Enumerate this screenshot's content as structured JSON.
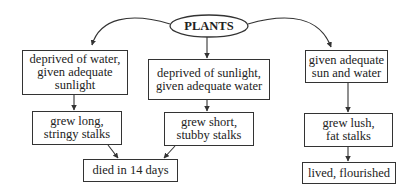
{
  "diagram": {
    "root": {
      "label": "PLANTS"
    },
    "nodes": [
      {
        "id": "n1",
        "label": "deprived of water,\ngiven adequate\nsunlight"
      },
      {
        "id": "n2",
        "label": "deprived of sunlight,\ngiven adequate water"
      },
      {
        "id": "n3",
        "label": "given adequate\nsun and water"
      },
      {
        "id": "n4",
        "label": "grew long,\nstringy stalks"
      },
      {
        "id": "n5",
        "label": "grew short,\nstubby stalks"
      },
      {
        "id": "n6",
        "label": "died in 14 days"
      },
      {
        "id": "n7",
        "label": "grew lush,\nfat stalks"
      },
      {
        "id": "n8",
        "label": "lived, flourished"
      }
    ],
    "edges": [
      [
        "root",
        "n1"
      ],
      [
        "root",
        "n2"
      ],
      [
        "root",
        "n3"
      ],
      [
        "n1",
        "n4"
      ],
      [
        "n2",
        "n5"
      ],
      [
        "n3",
        "n7"
      ],
      [
        "n4",
        "n6"
      ],
      [
        "n5",
        "n6"
      ],
      [
        "n7",
        "n8"
      ]
    ]
  }
}
